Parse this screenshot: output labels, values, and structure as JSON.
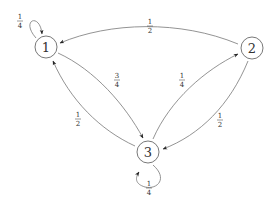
{
  "diagram": {
    "type": "markov-chain",
    "nodes": [
      {
        "id": "1",
        "label": "1",
        "x": 46,
        "y": 47
      },
      {
        "id": "2",
        "label": "2",
        "x": 252,
        "y": 48
      },
      {
        "id": "3",
        "label": "3",
        "x": 148,
        "y": 152
      }
    ],
    "edges": [
      {
        "from": "1",
        "to": "1",
        "label": {
          "num": "1",
          "den": "4"
        }
      },
      {
        "from": "2",
        "to": "1",
        "label": {
          "num": "1",
          "den": "2"
        }
      },
      {
        "from": "1",
        "to": "3",
        "label": {
          "num": "3",
          "den": "4"
        }
      },
      {
        "from": "3",
        "to": "1",
        "label": {
          "num": "1",
          "den": "2"
        }
      },
      {
        "from": "3",
        "to": "2",
        "label": {
          "num": "1",
          "den": "4"
        }
      },
      {
        "from": "2",
        "to": "3",
        "label": {
          "num": "1",
          "den": "2"
        }
      },
      {
        "from": "3",
        "to": "3",
        "label": {
          "num": "1",
          "den": "4"
        }
      }
    ],
    "colors": {
      "stroke": "#777777",
      "node_stroke": "#555555",
      "text": "#333333",
      "background": "#ffffff"
    }
  }
}
